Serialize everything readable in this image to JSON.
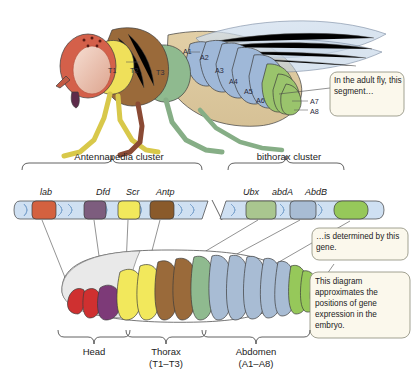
{
  "figure": {
    "background": "#ffffff"
  },
  "adult_fly": {
    "name": "adult-fly",
    "thorax_segments": [
      {
        "id": "T1",
        "label": "T1",
        "color": "#efe05a"
      },
      {
        "id": "T2",
        "label": "T2",
        "color": "#9a6a3a"
      },
      {
        "id": "T3",
        "label": "T3",
        "color": "#8fba8f"
      }
    ],
    "abdomen_segments": [
      {
        "id": "A1",
        "label": "A1",
        "color": "#9fb8d8"
      },
      {
        "id": "A2",
        "label": "A2",
        "color": "#9fb8d8"
      },
      {
        "id": "A3",
        "label": "A3",
        "color": "#9fb8d8"
      },
      {
        "id": "A4",
        "label": "A4",
        "color": "#9fb8d8"
      },
      {
        "id": "A5",
        "label": "A5",
        "color": "#9fb8d8"
      },
      {
        "id": "A6",
        "label": "A6",
        "color": "#8ec06a"
      },
      {
        "id": "A7",
        "label": "A7",
        "color": "#8ec06a"
      },
      {
        "id": "A8",
        "label": "A8",
        "color": "#8ec06a"
      }
    ],
    "head_color": "#d4604a",
    "eye_color": "#e8bfae",
    "wing_color": "#c9d8e8"
  },
  "clusters": [
    {
      "name": "antennapedia",
      "label": "Antennapedia cluster"
    },
    {
      "name": "bithorax",
      "label": "bithorax cluster"
    }
  ],
  "genes": [
    {
      "id": "lab",
      "label": "lab",
      "color": "#d4613f",
      "cluster": "antennapedia"
    },
    {
      "id": "Dfd",
      "label": "Dfd",
      "color": "#7d5d7e",
      "cluster": "antennapedia"
    },
    {
      "id": "Scr",
      "label": "Scr",
      "color": "#f2e85c",
      "cluster": "antennapedia"
    },
    {
      "id": "Antp",
      "label": "Antp",
      "color": "#8a5a2b",
      "cluster": "antennapedia"
    },
    {
      "id": "Ubx",
      "label": "Ubx",
      "color": "#a9c68f",
      "cluster": "bithorax"
    },
    {
      "id": "abdA",
      "label": "abdA",
      "color": "#a8bcd4",
      "cluster": "bithorax"
    },
    {
      "id": "AbdB",
      "label": "AbdB",
      "color": "#96c85a",
      "cluster": "bithorax"
    }
  ],
  "dna_helix_color": "#b9d2ea",
  "embryo": {
    "name": "embryo",
    "regions": [
      {
        "id": "head",
        "label": "Head",
        "sub": ""
      },
      {
        "id": "thorax",
        "label": "Thorax",
        "sub": "(T1–T3)"
      },
      {
        "id": "abdomen",
        "label": "Abdomen",
        "sub": "(A1–A8)"
      }
    ],
    "segment_colors": [
      "#dcdcdc",
      "#cf3030",
      "#cf3030",
      "#7d3a78",
      "#f2e85c",
      "#f2e85c",
      "#9a6a3a",
      "#9a6a3a",
      "#8fba8f",
      "#a8bcd4",
      "#a8bcd4",
      "#a8bcd4",
      "#a8bcd4",
      "#a8bcd4",
      "#96c85a",
      "#96c85a",
      "#96c85a"
    ]
  },
  "callouts": [
    {
      "id": "adult-segment",
      "text": "In the adult fly, this segment…"
    },
    {
      "id": "determined-gene",
      "text": "…is determined by this gene."
    },
    {
      "id": "diagram-note",
      "text": "This diagram approximates the positions of gene expression in the embryo."
    }
  ],
  "callout_style": {
    "fill": "#fbf8ec",
    "stroke": "#8a8a78"
  }
}
